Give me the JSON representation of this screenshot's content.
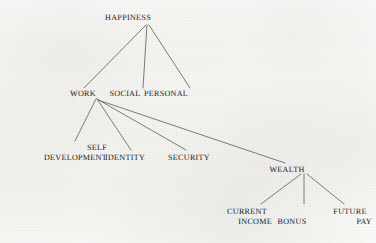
{
  "diagram": {
    "title": "HAPPINESS",
    "type": "hierarchical tree",
    "colors": {
      "background": "#fbfbfa",
      "text": "#1c1c1c",
      "edge": "#5c5c5c"
    },
    "nodes": {
      "happiness": {
        "label": "HAPPINESS",
        "x": 128,
        "y": 19,
        "level": 0
      },
      "work": {
        "label": "WORK",
        "x": 83,
        "y": 95,
        "level": 1
      },
      "social": {
        "label": "SOCIAL",
        "x": 125,
        "y": 95,
        "level": 1
      },
      "personal": {
        "label": "PERSONAL",
        "x": 166,
        "y": 95,
        "level": 1
      },
      "self_development_line1": {
        "label": "SELF",
        "x": 88,
        "y": 148,
        "level": 2
      },
      "self_development_line2": {
        "label": "DEVELOPMENT",
        "x": 88,
        "y": 158,
        "level": 2
      },
      "identity": {
        "label": "IDENTITY",
        "x": 125,
        "y": 158,
        "level": 2
      },
      "security": {
        "label": "SECURITY",
        "x": 189,
        "y": 158,
        "level": 2
      },
      "wealth": {
        "label": "WEALTH",
        "x": 287,
        "y": 170,
        "level": 2
      },
      "current_income_line1": {
        "label": "CURRENT",
        "x": 247,
        "y": 212,
        "level": 3
      },
      "current_income_line2": {
        "label": "INCOME",
        "x": 247,
        "y": 222,
        "level": 3
      },
      "bonus": {
        "label": "BONUS",
        "x": 292,
        "y": 222,
        "level": 3
      },
      "future_pay_line1": {
        "label": "FUTURE",
        "x": 350,
        "y": 212,
        "level": 3
      },
      "future_pay_line2": {
        "label": "PAY",
        "x": 350,
        "y": 222,
        "level": 3
      }
    },
    "edges": [
      {
        "from": "happiness",
        "to": "work",
        "x1": 146,
        "y1": 25,
        "x2": 84,
        "y2": 88
      },
      {
        "from": "happiness",
        "to": "social",
        "x1": 147,
        "y1": 25,
        "x2": 143,
        "y2": 88
      },
      {
        "from": "happiness",
        "to": "personal",
        "x1": 149,
        "y1": 25,
        "x2": 190,
        "y2": 88
      },
      {
        "from": "work",
        "to": "self_development",
        "x1": 96,
        "y1": 99,
        "x2": 75,
        "y2": 141
      },
      {
        "from": "work",
        "to": "identity",
        "x1": 97,
        "y1": 99,
        "x2": 131,
        "y2": 150
      },
      {
        "from": "work",
        "to": "security",
        "x1": 97,
        "y1": 99,
        "x2": 186,
        "y2": 150
      },
      {
        "from": "work",
        "to": "wealth",
        "x1": 98,
        "y1": 100,
        "x2": 285,
        "y2": 163
      },
      {
        "from": "wealth",
        "to": "current_income",
        "x1": 301,
        "y1": 174,
        "x2": 261,
        "y2": 204
      },
      {
        "from": "wealth",
        "to": "bonus",
        "x1": 304,
        "y1": 174,
        "x2": 304,
        "y2": 204
      },
      {
        "from": "wealth",
        "to": "future_pay",
        "x1": 307,
        "y1": 174,
        "x2": 344,
        "y2": 204
      }
    ]
  }
}
